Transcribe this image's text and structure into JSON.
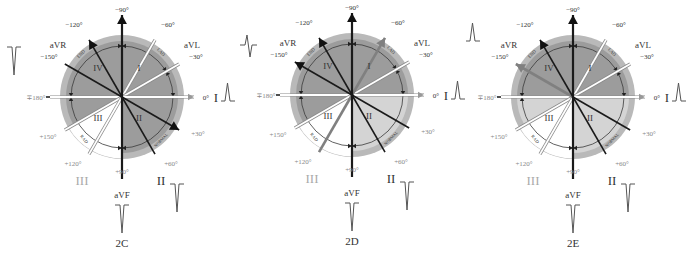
{
  "figure": {
    "colors": {
      "outer_ring": "#b9b9b9",
      "dark_sector": "#9c9c9c",
      "light_sector": "#d4d4d4",
      "white_sector": "#ffffff",
      "black_lead": "#1a1a1a",
      "gray_lead": "#808080",
      "label_text": "#333333",
      "faint_label": "#888888"
    },
    "panels": [
      {
        "id": "2C",
        "caption": "2C",
        "cx": 122,
        "cy": 97,
        "sectors": [
          {
            "from": -180,
            "to": 0,
            "fill": "dark"
          },
          {
            "from": 0,
            "to": 90,
            "fill": "dark"
          },
          {
            "from": 90,
            "to": 150,
            "fill": "white"
          },
          {
            "from": 150,
            "to": 180,
            "fill": "dark"
          }
        ],
        "white_leads": [
          -60,
          -30,
          0,
          180,
          150,
          120
        ],
        "black_leads": [
          -90,
          -120,
          -150,
          30,
          60,
          90
        ],
        "gray_leads": [],
        "arrowheads": [
          {
            "angle": -90,
            "color": "black"
          },
          {
            "angle": -120,
            "color": "black"
          },
          {
            "angle": 30,
            "color": "black"
          }
        ],
        "waveforms": {
          "aVR": "negative",
          "I": "positive",
          "aVF": "negative",
          "II": "negative"
        }
      },
      {
        "id": "2D",
        "caption": "2D",
        "cx": 352,
        "cy": 95,
        "sectors": [
          {
            "from": -180,
            "to": -30,
            "fill": "dark"
          },
          {
            "from": -30,
            "to": 0,
            "fill": "dark"
          },
          {
            "from": 0,
            "to": 90,
            "fill": "light"
          },
          {
            "from": 90,
            "to": 150,
            "fill": "white"
          },
          {
            "from": 150,
            "to": 180,
            "fill": "dark"
          }
        ],
        "white_leads": [
          -30,
          0,
          180,
          150
        ],
        "black_leads": [
          -90,
          -120,
          -150,
          30,
          60,
          90
        ],
        "gray_leads": [
          -60,
          120
        ],
        "arrowheads": [
          {
            "angle": -90,
            "color": "black"
          },
          {
            "angle": -120,
            "color": "black"
          },
          {
            "angle": -150,
            "color": "black"
          },
          {
            "angle": -60,
            "color": "gray"
          }
        ],
        "waveforms": {
          "aVR": "biphasic",
          "I": "positive",
          "aVF": "negative",
          "II": "negative"
        }
      },
      {
        "id": "2E",
        "caption": "2E",
        "cx": 573,
        "cy": 97,
        "sectors": [
          {
            "from": -180,
            "to": 0,
            "fill": "dark"
          },
          {
            "from": 0,
            "to": 90,
            "fill": "light"
          },
          {
            "from": 90,
            "to": 150,
            "fill": "white"
          },
          {
            "from": 150,
            "to": 180,
            "fill": "light"
          }
        ],
        "white_leads": [
          -60,
          -30,
          0,
          180,
          150,
          120
        ],
        "black_leads": [
          -90,
          -120,
          30,
          60,
          90
        ],
        "gray_leads": [
          -150
        ],
        "arrowheads": [
          {
            "angle": -90,
            "color": "black"
          },
          {
            "angle": -120,
            "color": "black"
          },
          {
            "angle": -150,
            "color": "gray"
          }
        ],
        "waveforms": {
          "aVR": "positive",
          "I": "positive",
          "aVF": "negative",
          "II": "negative"
        }
      }
    ],
    "labels": {
      "angles": {
        "m90": "−90°",
        "m120": "−120°",
        "m60": "−60°",
        "m150": "−150°",
        "m30": "−30°",
        "zero": "0°",
        "p180": "∓180°",
        "p150": "+150°",
        "p30": "+30°",
        "p120": "+120°",
        "p90": "+90°",
        "p60": "+60°"
      },
      "leads": {
        "aVR": "aVR",
        "aVL": "aVL",
        "aVF": "aVF",
        "I": "I",
        "II": "II",
        "III": "III"
      },
      "quadrants": {
        "q1": "I",
        "q2": "II",
        "q3": "III",
        "q4": "IV"
      },
      "arc_labels": {
        "ead": "END",
        "lad": "LAD",
        "rad": "RAD",
        "normal": "NORMAL"
      }
    }
  }
}
